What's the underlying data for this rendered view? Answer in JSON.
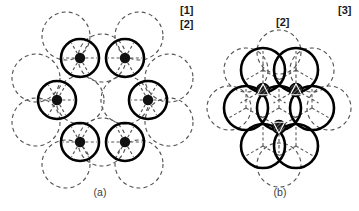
{
  "figure": {
    "background_color": "#ffffff",
    "solid_stroke_color": "#000000",
    "dashed_stroke_color": "#555555",
    "node_fill_color": "#111111",
    "panels": [
      {
        "id": "panel-a",
        "caption": "(a)",
        "caption_x": 100,
        "caption_y": 196,
        "description": "hexagonal ring of six separated solid circles, each with a filled central dot and radial dashed spokes, overlaid by dashed coordination circles",
        "labels": [
          {
            "text": "[1]",
            "x": 180,
            "y": 14
          },
          {
            "text": "[2]",
            "x": 180,
            "y": 28
          }
        ],
        "solid_circle_radius": 19,
        "dashed_circle_radius": 24,
        "center_dot_radius": 5.2,
        "spoke_length": 17,
        "spoke_count": 6,
        "circle_centers": [
          {
            "cx": 80,
            "cy": 58
          },
          {
            "cx": 125,
            "cy": 58
          },
          {
            "cx": 57,
            "cy": 100
          },
          {
            "cx": 148,
            "cy": 100
          },
          {
            "cx": 80,
            "cy": 142
          },
          {
            "cx": 125,
            "cy": 142
          }
        ],
        "dashed_circle_centers": [
          {
            "cx": 66,
            "cy": 36
          },
          {
            "cx": 139,
            "cy": 36
          },
          {
            "cx": 36,
            "cy": 78
          },
          {
            "cx": 169,
            "cy": 78
          },
          {
            "cx": 36,
            "cy": 122
          },
          {
            "cx": 169,
            "cy": 122
          },
          {
            "cx": 66,
            "cy": 164
          },
          {
            "cx": 139,
            "cy": 164
          },
          {
            "cx": 102,
            "cy": 58
          },
          {
            "cx": 102,
            "cy": 142
          },
          {
            "cx": 80,
            "cy": 100
          },
          {
            "cx": 125,
            "cy": 100
          }
        ]
      },
      {
        "id": "panel-b",
        "caption": "(b)",
        "caption_x": 280,
        "caption_y": 196,
        "description": "close-packed cluster of seven mutually touching solid circles with dashed coordination network and three hatched triangular interstitial nodes",
        "labels": [
          {
            "text": "[2]",
            "x": 276,
            "y": 26
          },
          {
            "text": "[3]",
            "x": 338,
            "y": 14
          }
        ],
        "solid_circle_radius": 22,
        "dashed_circle_radius": 22,
        "node_radius": 6.5,
        "circle_centers": [
          {
            "cx": 263,
            "cy": 70
          },
          {
            "cx": 296,
            "cy": 70
          },
          {
            "cx": 246,
            "cy": 108
          },
          {
            "cx": 279,
            "cy": 108
          },
          {
            "cx": 312,
            "cy": 108
          },
          {
            "cx": 263,
            "cy": 146
          },
          {
            "cx": 296,
            "cy": 146
          }
        ],
        "dashed_circle_centers": [
          {
            "cx": 246,
            "cy": 70
          },
          {
            "cx": 312,
            "cy": 70
          },
          {
            "cx": 229,
            "cy": 108
          },
          {
            "cx": 329,
            "cy": 108
          },
          {
            "cx": 279,
            "cy": 165
          },
          {
            "cx": 279,
            "cy": 52
          }
        ],
        "interstitial_nodes": [
          {
            "cx": 263,
            "cy": 90
          },
          {
            "cx": 296,
            "cy": 90
          },
          {
            "cx": 279,
            "cy": 127
          }
        ]
      }
    ]
  }
}
